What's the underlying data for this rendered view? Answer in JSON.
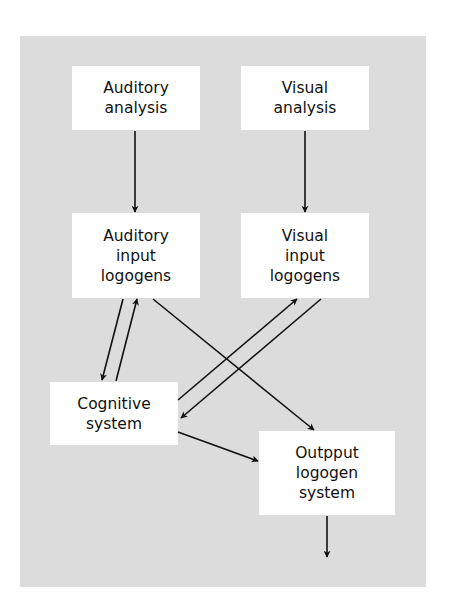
{
  "diagram": {
    "type": "flow-diagram",
    "nodes": [
      {
        "id": "auditory_analysis",
        "lines": [
          "Auditory",
          "analysis"
        ]
      },
      {
        "id": "visual_analysis",
        "lines": [
          "Visual",
          "analysis"
        ]
      },
      {
        "id": "auditory_input_logogens",
        "lines": [
          "Auditory",
          "input",
          "logogens"
        ]
      },
      {
        "id": "visual_input_logogens",
        "lines": [
          "Visual",
          "input",
          "logogens"
        ]
      },
      {
        "id": "cognitive_system",
        "lines": [
          "Cognitive",
          "system"
        ]
      },
      {
        "id": "output_logogen_system",
        "lines": [
          "Outpput",
          "logogen",
          "system"
        ]
      }
    ],
    "edges": [
      {
        "from": "auditory_analysis",
        "to": "auditory_input_logogens"
      },
      {
        "from": "visual_analysis",
        "to": "visual_input_logogens"
      },
      {
        "from": "auditory_input_logogens",
        "to": "cognitive_system"
      },
      {
        "from": "cognitive_system",
        "to": "auditory_input_logogens"
      },
      {
        "from": "auditory_input_logogens",
        "to": "output_logogen_system"
      },
      {
        "from": "cognitive_system",
        "to": "visual_input_logogens"
      },
      {
        "from": "visual_input_logogens",
        "to": "cognitive_system"
      },
      {
        "from": "cognitive_system",
        "to": "output_logogen_system"
      },
      {
        "from": "output_logogen_system",
        "to": "output"
      }
    ],
    "colors": {
      "background": "#dcdcdc",
      "box": "#ffffff",
      "line": "#111111"
    }
  }
}
